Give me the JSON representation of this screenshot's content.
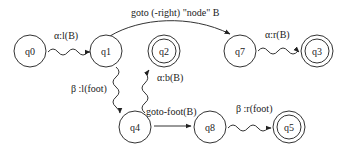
{
  "diagram": {
    "type": "state-machine",
    "states": {
      "q0": {
        "label": "q0",
        "accepting": false
      },
      "q1": {
        "label": "q1",
        "accepting": false
      },
      "q2": {
        "label": "q2",
        "accepting": true
      },
      "q7": {
        "label": "q7",
        "accepting": false
      },
      "q3": {
        "label": "q3",
        "accepting": true
      },
      "q4": {
        "label": "q4",
        "accepting": false
      },
      "q8": {
        "label": "q8",
        "accepting": false
      },
      "q5": {
        "label": "q5",
        "accepting": true
      }
    },
    "transitions": {
      "q0_q1": {
        "from": "q0",
        "to": "q1",
        "label": "α:l(B)",
        "style": "wavy"
      },
      "q1_q7": {
        "from": "q1",
        "to": "q7",
        "label": "goto (-right)  \"node\" B",
        "style": "curved"
      },
      "q7_q3": {
        "from": "q7",
        "to": "q3",
        "label": "α:r(B)",
        "style": "wavy"
      },
      "q1_q4": {
        "from": "q1",
        "to": "q4",
        "label": "β :l(foot)",
        "style": "wavy"
      },
      "q4_q2": {
        "from": "q4",
        "to": "q2",
        "label": "α:b(B)",
        "style": "wavy"
      },
      "q4_q8": {
        "from": "q4",
        "to": "q8",
        "label": "goto-foot(B)",
        "style": "straight"
      },
      "q8_q5": {
        "from": "q8",
        "to": "q5",
        "label": "β :r(foot)",
        "style": "wavy"
      }
    }
  }
}
